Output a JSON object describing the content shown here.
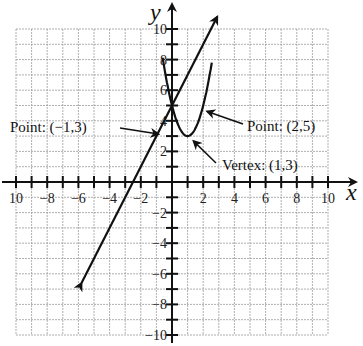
{
  "chart_data": {
    "type": "line",
    "title": "",
    "xlabel": "x",
    "ylabel": "y",
    "xlim": [
      -10,
      10
    ],
    "ylim": [
      -10,
      10
    ],
    "grid": true,
    "x_ticks": [
      -10,
      -8,
      -6,
      -4,
      -2,
      2,
      4,
      6,
      8,
      10
    ],
    "y_ticks": [
      10,
      8,
      6,
      4,
      2,
      -2,
      -4,
      -6,
      -8,
      -10
    ],
    "x_tick_labels": [
      "10",
      "−8",
      "−6",
      "−4",
      "−2",
      "2",
      "4",
      "6",
      "8",
      "10"
    ],
    "y_tick_labels": [
      "10",
      "8",
      "6",
      "4",
      "2",
      "−2",
      "−4",
      "−6",
      "−8",
      "−10"
    ],
    "series": [
      {
        "name": "parabola",
        "equation": "y = 2(x-1)^2 + 3",
        "x_range": [
          -0.6,
          2.55
        ],
        "arrows": false
      },
      {
        "name": "line",
        "equation": "y = 2x + 5",
        "x_range": [
          -5.8,
          2.9
        ],
        "arrows": true
      }
    ],
    "annotations": [
      {
        "label": "Point: (−1,3)",
        "point": [
          -1,
          3
        ]
      },
      {
        "label": "Point: (2,5)",
        "point": [
          2,
          5
        ]
      },
      {
        "label": "Vertex: (1,3)",
        "point": [
          1,
          3
        ]
      }
    ]
  }
}
